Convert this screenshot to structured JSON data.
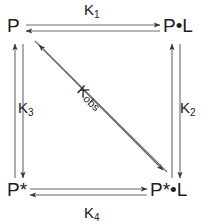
{
  "diagram": {
    "type": "thermodynamic-cycle",
    "title": "",
    "background_color": "#ffffff",
    "line_color": "#5a5a5a",
    "text_color": "#202020",
    "nodes": [
      {
        "id": "p",
        "label_main": "P",
        "star": "",
        "dot": "",
        "ligand": "",
        "position": "top-left",
        "text": "P"
      },
      {
        "id": "pl",
        "label_main": "P",
        "star": "",
        "dot": "•",
        "ligand": "L",
        "position": "top-right",
        "text": "P•L"
      },
      {
        "id": "pstar",
        "label_main": "P",
        "star": "*",
        "dot": "",
        "ligand": "",
        "position": "bottom-left",
        "text": "P*"
      },
      {
        "id": "pstarl",
        "label_main": "P",
        "star": "*",
        "dot": "•",
        "ligand": "L",
        "position": "bottom-right",
        "text": "P*•L"
      }
    ],
    "edges": [
      {
        "id": "k1",
        "label_main": "K",
        "subscript": "1",
        "from": "p",
        "to": "pl",
        "orientation": "horizontal",
        "side": "top",
        "reversible": true
      },
      {
        "id": "k2",
        "label_main": "K",
        "subscript": "2",
        "from": "pl",
        "to": "pstarl",
        "orientation": "vertical",
        "side": "right",
        "reversible": true
      },
      {
        "id": "k3",
        "label_main": "K",
        "subscript": "3",
        "from": "p",
        "to": "pstar",
        "orientation": "vertical",
        "side": "left",
        "reversible": true
      },
      {
        "id": "k4",
        "label_main": "K",
        "subscript": "4",
        "from": "pstar",
        "to": "pstarl",
        "orientation": "horizontal",
        "side": "bottom",
        "reversible": true
      },
      {
        "id": "kobs",
        "label_main": "K",
        "subscript": "obs",
        "from": "p",
        "to": "pstarl",
        "orientation": "diagonal",
        "side": "diagonal",
        "reversible": true
      }
    ]
  }
}
